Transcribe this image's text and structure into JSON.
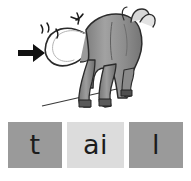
{
  "card": {
    "word": "tail",
    "background_color": "#ffffff"
  },
  "illustration": {
    "name": "cow-rear-view-with-swishing-tail",
    "subject": "cow",
    "view": "rear",
    "highlighted_part": "tail",
    "body_color": "#8a8a8a",
    "body_shadow_color": "#6f6f6f",
    "body_highlight_color": "#a8a8a8",
    "outline_color": "#2b2b2b",
    "tail_color": "#9a9a9a",
    "arrow": {
      "name": "pointer-arrow",
      "color": "#111111",
      "direction": "right",
      "points_at": "tail"
    },
    "motion_marks": {
      "name": "motion-swish-marks",
      "color": "#1c1c1c",
      "count": 4,
      "meaning": "tail swishing"
    },
    "ground_line": {
      "name": "ground-line",
      "color": "#3a3a3a"
    },
    "horns": {
      "name": "horns",
      "count": 2,
      "color": "#d0d0d0"
    }
  },
  "graphemes": [
    {
      "label": "t",
      "name": "grapheme-box-t",
      "background_color": "#9a9a9a",
      "text_color": "#1c1c1c",
      "highlight": false
    },
    {
      "label": "ai",
      "name": "grapheme-box-ai",
      "background_color": "#dcdcdc",
      "text_color": "#1c1c1c",
      "highlight": true
    },
    {
      "label": "l",
      "name": "grapheme-box-l",
      "background_color": "#9a9a9a",
      "text_color": "#1c1c1c",
      "highlight": false
    }
  ]
}
